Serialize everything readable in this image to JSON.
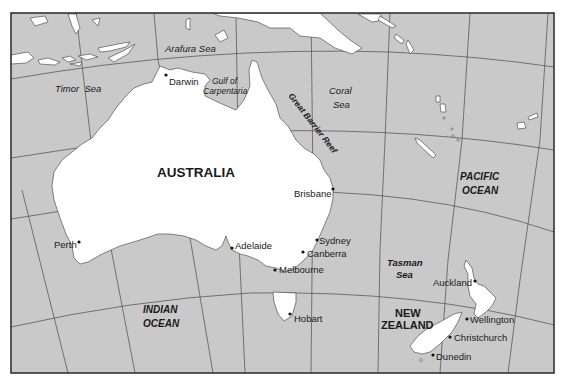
{
  "map": {
    "colors": {
      "ocean": "#c9c9c9",
      "land": "#ffffff",
      "outline": "#3a3a3a",
      "graticule": "#4a4a4a",
      "text": "#1a1a1a"
    },
    "countries": {
      "australia": "AUSTRALIA",
      "new_zealand_line1": "NEW",
      "new_zealand_line2": "ZEALAND"
    },
    "oceans": {
      "pacific_line1": "PACIFIC",
      "pacific_line2": "OCEAN",
      "indian_line1": "INDIAN",
      "indian_line2": "OCEAN"
    },
    "seas": {
      "arafura": "Arafura Sea",
      "timor": "Timor  Sea",
      "gulf_line1": "Gulf of",
      "gulf_line2": "Carpentaria",
      "coral_line1": "Coral",
      "coral_line2": "Sea",
      "tasman_line1": "Tasman",
      "tasman_line2": "Sea",
      "great_barrier_reef": "Great Barrier Reef"
    },
    "cities": {
      "darwin": "Darwin",
      "brisbane": "Brisbane",
      "perth": "Perth",
      "adelaide": "Adelaide",
      "sydney": "Sydney",
      "canberra": "Canberra",
      "melbourne": "Melbourne",
      "hobart": "Hobart",
      "auckland": "Auckland",
      "wellington": "Wellington",
      "christchurch": "Christchurch",
      "dunedin": "Dunedin"
    }
  }
}
